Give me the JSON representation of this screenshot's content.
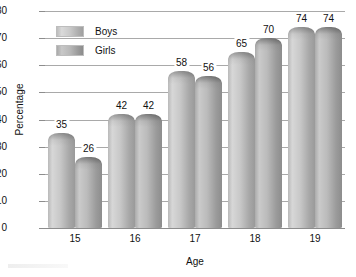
{
  "chart_data": {
    "type": "bar",
    "title": "",
    "subtitle": "",
    "xlabel": "Age",
    "ylabel": "Percentage",
    "categories": [
      "15",
      "16",
      "17",
      "18",
      "19"
    ],
    "series": [
      {
        "name": "Boys",
        "values": [
          35,
          42,
          58,
          65,
          74
        ]
      },
      {
        "name": "Girls",
        "values": [
          26,
          42,
          56,
          70,
          74
        ]
      }
    ],
    "ylim": [
      0,
      80
    ],
    "ytick_step": 10,
    "yticks": [
      "80",
      "70",
      "60",
      "50",
      "40",
      "30",
      "20",
      "10",
      "0"
    ],
    "grid": "horizontal",
    "legend_position": "inside-upper-left",
    "colors": {
      "boys": "#c8c8c8",
      "girls": "#b0b0b0",
      "gridline": "#a9a9a9",
      "axis": "#8d8d8d",
      "text": "#111111",
      "background": "#ffffff"
    },
    "data_labels": {
      "boys": [
        "35",
        "42",
        "58",
        "65",
        "74"
      ],
      "girls": [
        "26",
        "42",
        "56",
        "70",
        "74"
      ]
    }
  },
  "legend": {
    "items": [
      {
        "label": "Boys"
      },
      {
        "label": "Girls"
      }
    ]
  }
}
